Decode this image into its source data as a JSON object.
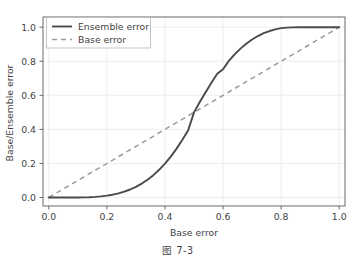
{
  "figure": {
    "caption": "图  7-3",
    "scan_artifact": "·· ···· ··  ·· ·· ·· ·  ··· ···"
  },
  "chart_data": {
    "type": "line",
    "title": "",
    "xlabel": "Base error",
    "ylabel": "Base/Ensemble error",
    "xlim": [
      -0.02,
      1.02
    ],
    "ylim": [
      -0.05,
      1.06
    ],
    "xticks": [
      0.0,
      0.2,
      0.4,
      0.6,
      0.8,
      1.0
    ],
    "xticklabels": [
      "0.0",
      "0.2",
      "0.4",
      "0.6",
      "0.8",
      "1.0"
    ],
    "yticks": [
      0.0,
      0.2,
      0.4,
      0.6,
      0.8,
      1.0
    ],
    "yticklabels": [
      "0.0",
      "0.2",
      "0.4",
      "0.6",
      "0.8",
      "1.0"
    ],
    "grid": true,
    "legend_position": "upper left",
    "series": [
      {
        "name": "Ensemble error",
        "style": "solid",
        "color": "#4a4a4a",
        "x": [
          0.0,
          0.02,
          0.04,
          0.06,
          0.08,
          0.1,
          0.12,
          0.14,
          0.16,
          0.18,
          0.2,
          0.22,
          0.24,
          0.26,
          0.28,
          0.3,
          0.32,
          0.34,
          0.36,
          0.38,
          0.4,
          0.42,
          0.44,
          0.46,
          0.48,
          0.5,
          0.52,
          0.54,
          0.56,
          0.58,
          0.6,
          0.62,
          0.64,
          0.66,
          0.68,
          0.7,
          0.72,
          0.74,
          0.76,
          0.78,
          0.8,
          0.82,
          0.84,
          0.86,
          0.88,
          0.9,
          0.92,
          0.94,
          0.96,
          0.98,
          1.0
        ],
        "y": [
          0.0,
          0.0,
          0.0,
          0.0,
          0.0001,
          0.0003,
          0.0008,
          0.0018,
          0.0036,
          0.0065,
          0.0106,
          0.0164,
          0.0242,
          0.0343,
          0.0469,
          0.0626,
          0.0817,
          0.1045,
          0.1313,
          0.1627,
          0.1989,
          0.2403,
          0.287,
          0.3388,
          0.3953,
          0.5,
          0.5609,
          0.6182,
          0.674,
          0.7266,
          0.7535,
          0.8025,
          0.8403,
          0.8744,
          0.9033,
          0.9279,
          0.9483,
          0.9648,
          0.9776,
          0.9874,
          0.9944,
          0.9975,
          0.9991,
          0.9997,
          0.9999,
          1.0,
          1.0,
          1.0,
          1.0,
          1.0,
          1.0
        ]
      },
      {
        "name": "Base error",
        "style": "dashed",
        "color": "#9a9a9a",
        "x": [
          0.0,
          1.0
        ],
        "y": [
          0.0,
          1.0
        ]
      }
    ]
  },
  "axes": {
    "spine_color": "#5a5a5a",
    "grid_color": "#e8e8ec",
    "tick_color": "#5a5a5a"
  },
  "legend": {
    "items": [
      {
        "label": "Ensemble error",
        "style": "solid"
      },
      {
        "label": "Base error",
        "style": "dashed"
      }
    ],
    "border_color": "#b6b6b6",
    "background": "#ffffff"
  }
}
